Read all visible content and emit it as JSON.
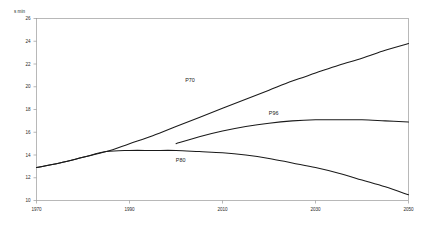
{
  "chart_data": {
    "type": "line",
    "title": "",
    "subtitle": "",
    "xlabel": "",
    "ylabel": "s min",
    "xlim": [
      1970,
      2050
    ],
    "ylim": [
      10,
      26
    ],
    "grid": false,
    "legend_position": "inline-annotations",
    "x_ticks": [
      "1970",
      "1990",
      "2010",
      "2030",
      "2050"
    ],
    "x_tick_values": [
      1970,
      1990,
      2010,
      2030,
      2050
    ],
    "y_ticks": [
      "10",
      "12",
      "14",
      "16",
      "18",
      "20",
      "22",
      "24",
      "26"
    ],
    "y_tick_values": [
      10,
      12,
      14,
      16,
      18,
      20,
      22,
      24,
      26
    ],
    "series": [
      {
        "name": "P70",
        "label": "P70",
        "label_x": 2003,
        "label_y": 20.4,
        "x": [
          1970,
          1975,
          1980,
          1985,
          1990,
          1995,
          2000,
          2005,
          2010,
          2015,
          2020,
          2025,
          2030,
          2035,
          2040,
          2045,
          2050
        ],
        "values": [
          12.9,
          13.3,
          13.8,
          14.3,
          15.0,
          15.7,
          16.5,
          17.3,
          18.1,
          18.9,
          19.7,
          20.5,
          21.2,
          21.9,
          22.5,
          23.2,
          23.8
        ]
      },
      {
        "name": "P96",
        "label": "P96",
        "label_x": 2021,
        "label_y": 17.5,
        "x": [
          2000,
          2005,
          2010,
          2015,
          2020,
          2025,
          2030,
          2035,
          2040,
          2045,
          2050
        ],
        "values": [
          15.0,
          15.6,
          16.1,
          16.5,
          16.8,
          17.0,
          17.1,
          17.1,
          17.1,
          17.0,
          16.9
        ]
      },
      {
        "name": "P80",
        "label": "P80",
        "label_x": 2001,
        "label_y": 13.4,
        "x": [
          1970,
          1975,
          1980,
          1985,
          1990,
          1995,
          2000,
          2005,
          2010,
          2015,
          2020,
          2025,
          2030,
          2035,
          2040,
          2045,
          2050
        ],
        "values": [
          12.9,
          13.3,
          13.8,
          14.3,
          14.4,
          14.4,
          14.4,
          14.3,
          14.2,
          14.0,
          13.7,
          13.3,
          12.9,
          12.4,
          11.8,
          11.2,
          10.5
        ]
      }
    ]
  }
}
